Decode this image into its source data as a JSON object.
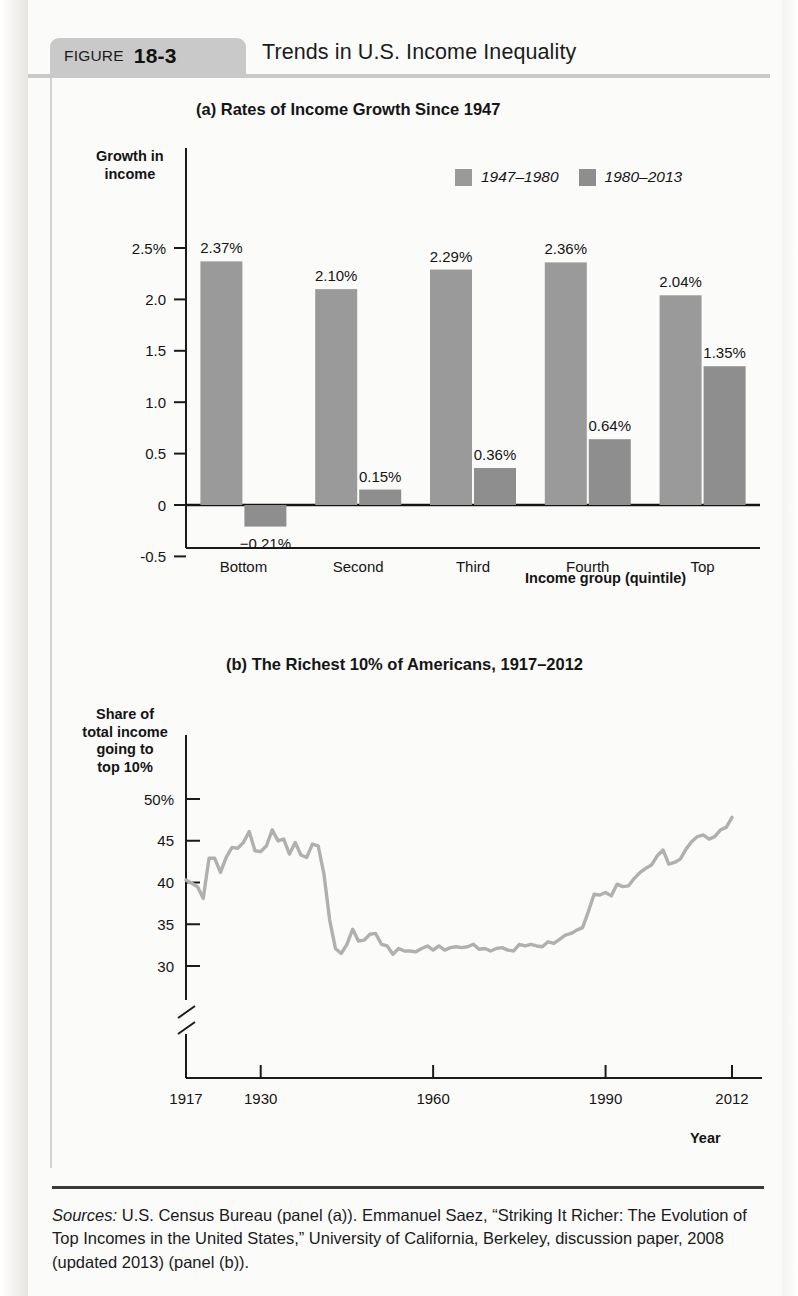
{
  "figure": {
    "label_word": "FIGURE",
    "number": "18-3",
    "title": "Trends in U.S. Income Inequality"
  },
  "colors": {
    "bar_1947_1980": "#9a9a9a",
    "bar_1980_2013": "#8e8e8e",
    "line": "#b0b0b0",
    "axis": "#1a1a1a",
    "tab_background": "#c9c9c9"
  },
  "source": {
    "lead": "Sources:",
    "text": " U.S. Census Bureau (panel (a)). Emmanuel Saez, “Striking It Richer: The Evolution of Top Incomes in the United States,” University of California, Berkeley, discussion paper, 2008 (updated 2013) (panel (b))."
  },
  "chart_data": [
    {
      "type": "bar",
      "panel": "(a)",
      "title": "(a) Rates of Income Growth Since 1947",
      "xlabel": "Income group (quintile)",
      "ylabel": "Growth in income",
      "categories": [
        "Bottom",
        "Second",
        "Third",
        "Fourth",
        "Top"
      ],
      "ylim": [
        -0.5,
        2.5
      ],
      "yticks": [
        "2.5%",
        "2.0",
        "1.5",
        "1.0",
        "0.5",
        "0",
        "-0.5"
      ],
      "ytick_values": [
        2.5,
        2.0,
        1.5,
        1.0,
        0.5,
        0,
        -0.5
      ],
      "grid": false,
      "legend_position": "top-right",
      "series": [
        {
          "name": "1947–1980",
          "color": "#9a9a9a",
          "values": [
            2.37,
            2.1,
            2.29,
            2.36,
            2.04
          ],
          "labels": [
            "2.37%",
            "2.10%",
            "2.29%",
            "2.36%",
            "2.04%"
          ]
        },
        {
          "name": "1980–2013",
          "color": "#8e8e8e",
          "values": [
            -0.21,
            0.15,
            0.36,
            0.64,
            1.35
          ],
          "labels": [
            "−0.21%",
            "0.15%",
            "0.36%",
            "0.64%",
            "1.35%"
          ]
        }
      ]
    },
    {
      "type": "line",
      "panel": "(b)",
      "title": "(b) The Richest 10% of Americans, 1917–2012",
      "xlabel": "Year",
      "ylabel": "Share of total income going to top 10%",
      "ylim": [
        30,
        50
      ],
      "yticks": [
        "50%",
        "45",
        "40",
        "35",
        "30"
      ],
      "ytick_values": [
        50,
        45,
        40,
        35,
        30
      ],
      "xlim": [
        1917,
        2012
      ],
      "xticks": [
        "1917",
        "1930",
        "1960",
        "1990",
        "2012"
      ],
      "xtick_values": [
        1917,
        1930,
        1960,
        1990,
        2012
      ],
      "axis_break": true,
      "grid": false,
      "legend_position": "none",
      "x": [
        1917,
        1918,
        1919,
        1920,
        1921,
        1922,
        1923,
        1924,
        1925,
        1926,
        1927,
        1928,
        1929,
        1930,
        1931,
        1932,
        1933,
        1934,
        1935,
        1936,
        1937,
        1938,
        1939,
        1940,
        1941,
        1942,
        1943,
        1944,
        1945,
        1946,
        1947,
        1948,
        1949,
        1950,
        1951,
        1952,
        1953,
        1954,
        1955,
        1956,
        1957,
        1958,
        1959,
        1960,
        1961,
        1962,
        1963,
        1964,
        1965,
        1966,
        1967,
        1968,
        1969,
        1970,
        1971,
        1972,
        1973,
        1974,
        1975,
        1976,
        1977,
        1978,
        1979,
        1980,
        1981,
        1982,
        1983,
        1984,
        1985,
        1986,
        1987,
        1988,
        1989,
        1990,
        1991,
        1992,
        1993,
        1994,
        1995,
        1996,
        1997,
        1998,
        1999,
        2000,
        2001,
        2002,
        2003,
        2004,
        2005,
        2006,
        2007,
        2008,
        2009,
        2010,
        2011,
        2012
      ],
      "y": [
        40.3,
        39.9,
        39.5,
        38.1,
        42.9,
        42.9,
        41.2,
        43.0,
        44.2,
        44.1,
        44.8,
        46.1,
        43.8,
        43.7,
        44.4,
        46.3,
        45.0,
        45.2,
        43.4,
        44.8,
        43.3,
        43.0,
        44.6,
        44.4,
        41.0,
        35.5,
        32.1,
        31.5,
        32.6,
        34.4,
        33.0,
        33.1,
        33.8,
        33.9,
        32.6,
        32.4,
        31.4,
        32.1,
        31.8,
        31.8,
        31.7,
        32.1,
        32.4,
        31.9,
        32.4,
        31.9,
        32.2,
        32.3,
        32.2,
        32.3,
        32.6,
        32.0,
        32.1,
        31.8,
        32.1,
        32.2,
        31.9,
        31.8,
        32.6,
        32.4,
        32.6,
        32.4,
        32.3,
        32.9,
        32.7,
        33.2,
        33.7,
        33.9,
        34.3,
        34.6,
        36.5,
        38.6,
        38.5,
        38.8,
        38.4,
        39.8,
        39.5,
        39.6,
        40.5,
        41.2,
        41.7,
        42.1,
        43.2,
        43.9,
        42.2,
        42.4,
        42.8,
        44.0,
        44.9,
        45.5,
        45.7,
        45.2,
        45.5,
        46.3,
        46.6,
        47.8
      ]
    }
  ]
}
